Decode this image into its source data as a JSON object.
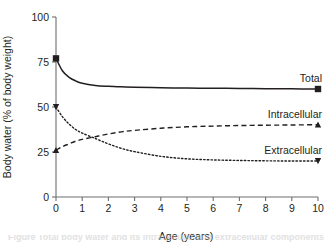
{
  "figure": {
    "caption_fragment": "Figure   Total body water and its intracellular and extracellular components"
  },
  "chart_data": {
    "type": "line",
    "title": "",
    "xlabel": "Age (years)",
    "ylabel": "Body water (% of body weight)",
    "xlim": [
      0,
      10
    ],
    "ylim": [
      0,
      100
    ],
    "xticks": [
      0,
      1,
      2,
      3,
      4,
      5,
      6,
      7,
      8,
      9,
      10
    ],
    "yticks": [
      0,
      25,
      50,
      75,
      100
    ],
    "xtick_labels": [
      "0",
      "1",
      "2",
      "3",
      "4",
      "5",
      "6",
      "7",
      "8",
      "9",
      "10"
    ],
    "ytick_labels": [
      "0",
      "25",
      "50",
      "75",
      "100"
    ],
    "grid": false,
    "legend_position": "right-inline",
    "x": [
      0,
      0.25,
      0.5,
      0.75,
      1,
      1.5,
      2,
      2.5,
      3,
      4,
      5,
      6,
      7,
      8,
      9,
      10
    ],
    "series": [
      {
        "name": "Total",
        "label": "Total",
        "line_style": "solid",
        "end_marker": "square",
        "start_marker": "square",
        "values": [
          77,
          70,
          66.5,
          64.5,
          63.2,
          62.0,
          61.5,
          61.2,
          61.0,
          60.7,
          60.5,
          60.4,
          60.3,
          60.2,
          60.1,
          60.0
        ]
      },
      {
        "name": "Intracellular",
        "label": "Intracellular",
        "line_style": "dashed",
        "end_marker": "triangle-up",
        "start_marker": "triangle-up",
        "values": [
          26,
          28,
          29.5,
          31,
          32,
          33.5,
          35,
          36.2,
          37,
          38.2,
          39.0,
          39.4,
          39.7,
          39.9,
          40.0,
          40.2
        ]
      },
      {
        "name": "Extracellular",
        "label": "Extracellular",
        "line_style": "dotted",
        "end_marker": "triangle-down",
        "start_marker": "triangle-down",
        "values": [
          50,
          44.5,
          40.5,
          37.5,
          35.5,
          32.5,
          29.5,
          27.0,
          25.2,
          22.6,
          21.2,
          20.6,
          20.3,
          20.1,
          20.0,
          20.0
        ]
      }
    ],
    "annotations": [
      {
        "text": "Total",
        "x": 10,
        "y": 60
      },
      {
        "text": "Intracellular",
        "x": 10,
        "y": 40
      },
      {
        "text": "Extracellular",
        "x": 10,
        "y": 20
      }
    ]
  }
}
